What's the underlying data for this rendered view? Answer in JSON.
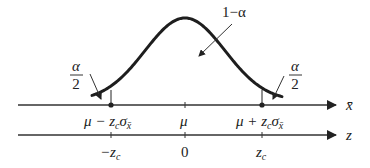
{
  "colors": {
    "ink": "#222222",
    "curve": "#1e1e1e",
    "background": "#ffffff"
  },
  "annotations": {
    "center_area": "1−α",
    "left_tail_numerator": "α",
    "left_tail_denominator": "2",
    "right_tail_numerator": "α",
    "right_tail_denominator": "2"
  },
  "xbar_axis": {
    "label": "x̄",
    "ticks": {
      "left_critical": {
        "base": "μ − z",
        "sub_c": "c",
        "sigma": "σ",
        "sub_x": "x̄"
      },
      "center": "μ",
      "right_critical": {
        "base": "μ + z",
        "sub_c": "c",
        "sigma": "σ",
        "sub_x": "x̄"
      }
    }
  },
  "z_axis": {
    "label": "z",
    "ticks": {
      "left": {
        "base": "−z",
        "sub": "c"
      },
      "center": "0",
      "right": {
        "base": "z",
        "sub": "c"
      }
    }
  }
}
